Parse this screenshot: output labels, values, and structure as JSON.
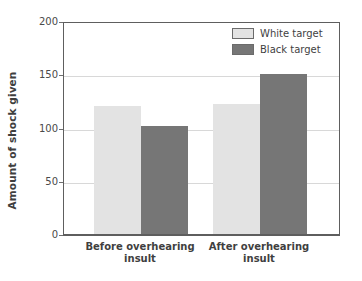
{
  "chart_data": {
    "type": "bar",
    "title": "",
    "xlabel": "",
    "ylabel": "Amount of shock given",
    "categories": [
      "Before overhearing insult",
      "After overhearing insult"
    ],
    "category_lines": [
      [
        "Before overhearing",
        "insult"
      ],
      [
        "After overhearing",
        "insult"
      ]
    ],
    "series": [
      {
        "name": "White target",
        "values": [
          120,
          122
        ],
        "color": "#e3e3e3"
      },
      {
        "name": "Black target",
        "values": [
          101,
          150
        ],
        "color": "#767676"
      }
    ],
    "ylim": [
      0,
      200
    ],
    "yticks": [
      0,
      50,
      100,
      150,
      200
    ],
    "ytick_labels": [
      "0",
      "50",
      "100",
      "150",
      "200"
    ],
    "gridlines": [
      50,
      100,
      150
    ],
    "grid": true,
    "legend_position": "top-right"
  },
  "legend": {
    "items": [
      {
        "label": "White target",
        "swatch": "light"
      },
      {
        "label": "Black target",
        "swatch": "dark"
      }
    ]
  },
  "colors": {
    "light_bar": "#e3e3e3",
    "dark_bar": "#767676",
    "axis": "#5e5e5e",
    "grid": "#d8d8d8",
    "text": "#3f3f3f"
  }
}
